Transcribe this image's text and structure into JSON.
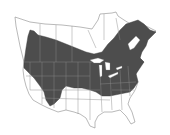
{
  "map": {
    "region": "North America (United States and southern Canada)",
    "type": "species range map",
    "colors": {
      "background": "#ffffff",
      "range_fill": "#4d4d4d",
      "land_fill": "#ffffff",
      "border_stroke": "#8a8a8a",
      "lakes": "#ffffff"
    },
    "legend": []
  }
}
